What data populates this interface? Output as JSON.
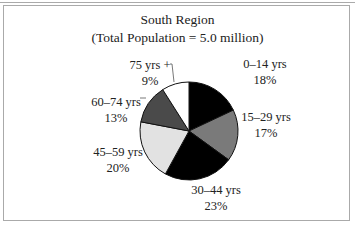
{
  "chart_data": {
    "type": "pie",
    "title": "South Region",
    "subtitle": "(Total Population = 5.0 million)",
    "categories": [
      "0–14 yrs",
      "15–29 yrs",
      "30–44 yrs",
      "45–59 yrs",
      "60–74 yrs",
      "75 yrs +"
    ],
    "values": [
      18,
      17,
      23,
      20,
      13,
      9
    ],
    "labels": [
      "18%",
      "17%",
      "23%",
      "20%",
      "13%",
      "9%"
    ],
    "colors": [
      "#000000",
      "#7a7a7a",
      "#000000",
      "#e2e2e2",
      "#4a4a4a",
      "#ffffff"
    ],
    "start_angle_deg": 0,
    "direction": "clockwise",
    "legend": "none"
  }
}
